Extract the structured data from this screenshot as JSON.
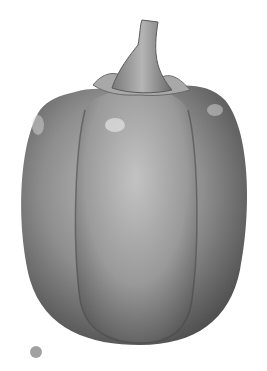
{
  "image": {
    "subject": "Pencil drawing of a bell pepper",
    "background_color": "#ffffff",
    "shading_color": "#8a8a8a",
    "dark_color": "#4a4a4a",
    "highlight_color": "#d8d8d8"
  }
}
